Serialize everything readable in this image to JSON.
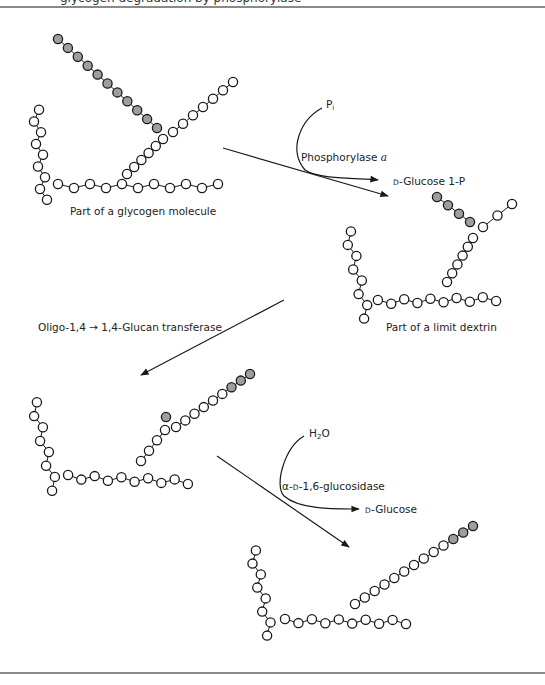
{
  "figure": {
    "header_cut_text": "glycogen degradation by phosphorylase",
    "colors": {
      "unit_fill": "#ffffff",
      "released_fill": "#9e9e9e",
      "stroke": "#1a1a1a",
      "rule": "#8a8a8a"
    }
  },
  "labels": {
    "molecule1": "Part of a glycogen molecule",
    "molecule2": "Part of a limit dextrin",
    "pi": "P",
    "pi_sub": "i",
    "enzyme1_name": "Phosphorylase ",
    "enzyme1_form": "a",
    "product1_prefix": "D",
    "product1": "-Glucose 1-P",
    "enzyme2": "Oligo-1,4 → 1,4-Glucan transferase",
    "h2o_h": "H",
    "h2o_sub": "2",
    "h2o_o": "O",
    "enzyme3_alpha": "α-",
    "enzyme3_d": "D",
    "enzyme3_rest": "-1,6-glucosidase",
    "product3_prefix": "D",
    "product3": "-Glucose"
  },
  "molecules": [
    {
      "id": "glycogen",
      "chains": [
        {
          "name": "vertical-branch",
          "start": [
            36,
            110
          ],
          "end": [
            44,
            200
          ],
          "n": 9,
          "shaded": 0,
          "wiggle": 3
        },
        {
          "name": "main-chain",
          "start": [
            58,
            186
          ],
          "end": [
            218,
            186
          ],
          "n": 11,
          "shaded": 0,
          "wiggle": 2
        },
        {
          "name": "diagonal-inner",
          "start": [
            127,
            174
          ],
          "end": [
            163,
            139
          ],
          "n": 6,
          "shaded": 0,
          "wiggle": 0
        },
        {
          "name": "diagonal-outer",
          "start": [
            173,
            132
          ],
          "end": [
            233,
            82
          ],
          "n": 7,
          "shaded": 0,
          "wiggle": 0
        },
        {
          "name": "released-chain",
          "start": [
            58,
            39
          ],
          "end": [
            157,
            128
          ],
          "n": 11,
          "shaded": 11,
          "wiggle": 0
        }
      ],
      "label_pos": [
        70,
        213
      ]
    },
    {
      "id": "limit-dextrin",
      "chains": [
        {
          "name": "vertical-branch",
          "start": [
            348,
            232
          ],
          "end": [
            367,
            318
          ],
          "n": 8,
          "shaded": 0,
          "wiggle": 3
        },
        {
          "name": "main-chain",
          "start": [
            378,
            302
          ],
          "end": [
            496,
            299
          ],
          "n": 10,
          "shaded": 0,
          "wiggle": 2
        },
        {
          "name": "diagonal-inner",
          "start": [
            447,
            282
          ],
          "end": [
            473,
            238
          ],
          "n": 6,
          "shaded": 0,
          "wiggle": 0
        },
        {
          "name": "diagonal-outer",
          "start": [
            483,
            227
          ],
          "end": [
            512,
            204
          ],
          "n": 3,
          "shaded": 0,
          "wiggle": 0
        },
        {
          "name": "stub-chain",
          "start": [
            437,
            197
          ],
          "end": [
            470,
            222
          ],
          "n": 4,
          "shaded": 4,
          "wiggle": 0
        }
      ],
      "label_pos": [
        386,
        322
      ]
    },
    {
      "id": "transferred",
      "chains": [
        {
          "name": "vertical-branch",
          "start": [
            34,
            403
          ],
          "end": [
            55,
            490
          ],
          "n": 8,
          "shaded": 0,
          "wiggle": 3
        },
        {
          "name": "main-chain",
          "start": [
            68,
            477
          ],
          "end": [
            188,
            482
          ],
          "n": 10,
          "shaded": 0,
          "wiggle": 2
        },
        {
          "name": "diagonal-inner",
          "start": [
            141,
            461
          ],
          "end": [
            165,
            430
          ],
          "n": 4,
          "shaded": 0,
          "wiggle": 0
        },
        {
          "name": "diagonal-outer",
          "start": [
            176,
            427
          ],
          "end": [
            250,
            374
          ],
          "n": 9,
          "shaded": 3,
          "wiggle": 0
        },
        {
          "name": "single-stub",
          "start": [
            166,
            417
          ],
          "end": [
            166,
            417
          ],
          "n": 1,
          "shaded": 1,
          "wiggle": 0
        }
      ]
    },
    {
      "id": "debranched",
      "chains": [
        {
          "name": "vertical-branch",
          "start": [
            253,
            551
          ],
          "end": [
            270,
            635
          ],
          "n": 8,
          "shaded": 0,
          "wiggle": 3
        },
        {
          "name": "main-chain",
          "start": [
            285,
            621
          ],
          "end": [
            406,
            622
          ],
          "n": 10,
          "shaded": 0,
          "wiggle": 2
        },
        {
          "name": "diagonal",
          "start": [
            355,
            604
          ],
          "end": [
            473,
            526
          ],
          "n": 13,
          "shaded": 3,
          "wiggle": 0
        }
      ]
    }
  ],
  "arrows": [
    {
      "name": "phosphorylase-main-arrow",
      "d": "M223,148 L388,196",
      "head": [
        388,
        196
      ]
    },
    {
      "name": "phosphorylase-cosubstrate-curve",
      "d": "M322,108 C300,120 288,150 305,170 C320,180 360,178 378,180",
      "head": [
        378,
        180
      ]
    },
    {
      "name": "transferase-arrow",
      "d": "M284,300 L141,375",
      "head": [
        141,
        375
      ]
    },
    {
      "name": "glucosidase-main-arrow",
      "d": "M217,456 L349,547",
      "head": [
        349,
        547
      ]
    },
    {
      "name": "glucosidase-cosubstrate-curve",
      "d": "M304,436 C284,448 274,486 284,496 C300,510 336,509 359,509",
      "head": [
        359,
        509
      ]
    }
  ]
}
